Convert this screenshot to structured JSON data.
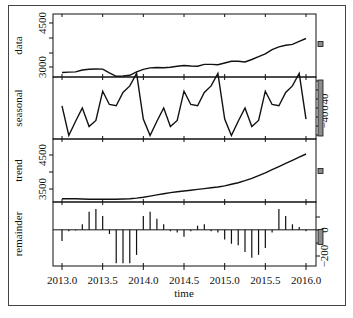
{
  "chart_data": {
    "type": "line",
    "title": "",
    "xlabel": "time",
    "x_ticks": [
      "2013.0",
      "2013.5",
      "2014.0",
      "2014.5",
      "2015.0",
      "2015.5",
      "2016.0"
    ],
    "x_range": [
      2013.0,
      2016.0
    ],
    "x_start": 2013.0,
    "x_step": 0.0833333,
    "panels": [
      {
        "name": "data",
        "ylabel": "data",
        "yticks": [
          "3000",
          "4500"
        ],
        "ylim": [
          2900,
          4700
        ],
        "style": "line",
        "values": [
          3030,
          3040,
          3045,
          3100,
          3120,
          3130,
          3125,
          3020,
          2920,
          2930,
          2950,
          3050,
          3120,
          3160,
          3170,
          3165,
          3180,
          3210,
          3230,
          3215,
          3210,
          3260,
          3260,
          3250,
          3300,
          3350,
          3350,
          3330,
          3400,
          3480,
          3560,
          3680,
          3760,
          3810,
          3830,
          3920,
          4000
        ]
      },
      {
        "name": "seasonal",
        "ylabel": "seasonal",
        "yticks": [
          "40",
          "0",
          "-40"
        ],
        "ylim": [
          -70,
          70
        ],
        "style": "line",
        "values": [
          5,
          -62,
          -30,
          0,
          -42,
          -28,
          38,
          8,
          5,
          35,
          50,
          78,
          -25,
          -62,
          -30,
          0,
          -42,
          -28,
          38,
          8,
          5,
          35,
          50,
          78,
          -25,
          -62,
          -30,
          0,
          -42,
          -28,
          38,
          8,
          5,
          35,
          50,
          78,
          -25
        ]
      },
      {
        "name": "trend",
        "ylabel": "trend",
        "yticks": [
          "3500",
          "4500"
        ],
        "ylim": [
          3150,
          4750
        ],
        "style": "line",
        "values": [
          3230,
          3230,
          3230,
          3225,
          3220,
          3220,
          3220,
          3220,
          3220,
          3225,
          3235,
          3250,
          3270,
          3300,
          3330,
          3360,
          3390,
          3410,
          3430,
          3450,
          3470,
          3490,
          3510,
          3530,
          3560,
          3600,
          3640,
          3690,
          3750,
          3820,
          3890,
          3970,
          4050,
          4130,
          4210,
          4290,
          4370
        ]
      },
      {
        "name": "remainder",
        "ylabel": "remainder",
        "yticks": [
          "0",
          "-200"
        ],
        "ylim": [
          -260,
          200
        ],
        "style": "bar",
        "values": [
          -80,
          -10,
          -5,
          40,
          130,
          150,
          100,
          -30,
          -240,
          -240,
          -240,
          -180,
          100,
          130,
          80,
          40,
          -10,
          -20,
          -50,
          -10,
          30,
          40,
          -10,
          -20,
          -70,
          -100,
          -110,
          -160,
          -200,
          -180,
          -130,
          -20,
          150,
          100,
          40,
          20,
          -10
        ]
      }
    ],
    "range_bars": [
      {
        "panel": "data",
        "height_px": 5
      },
      {
        "panel": "seasonal",
        "height_px": 56
      },
      {
        "panel": "trend",
        "height_px": 5
      },
      {
        "panel": "remainder",
        "height_px": 15
      }
    ]
  },
  "colors": {
    "line": "#111111",
    "rangebar": "#8c8c8c",
    "frame": "#444444"
  }
}
